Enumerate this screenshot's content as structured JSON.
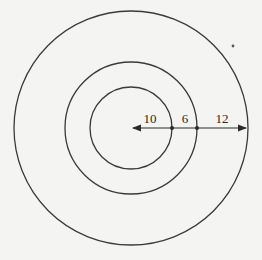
{
  "diagram": {
    "type": "concentric-circles",
    "rings": [
      {
        "name": "inner",
        "radius_units": 10
      },
      {
        "name": "middle",
        "radius_units": 16
      },
      {
        "name": "outer",
        "radius_units": 28
      }
    ],
    "segments": [
      {
        "label": "10"
      },
      {
        "label": "6"
      },
      {
        "label": "12"
      }
    ],
    "colors": {
      "stroke": "#3a3a3a",
      "background": "#f4f4f2"
    }
  }
}
